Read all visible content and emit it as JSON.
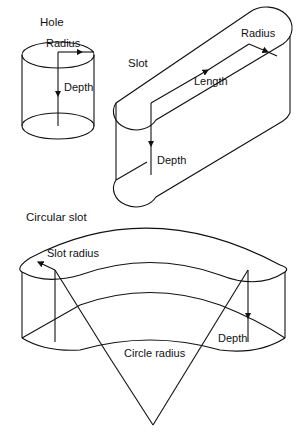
{
  "figure": {
    "hole": {
      "title": "Hole",
      "labels": {
        "radius": "Radius",
        "depth": "Depth"
      }
    },
    "slot": {
      "title": "Slot",
      "labels": {
        "radius": "Radius",
        "length": "Length",
        "depth": "Depth"
      }
    },
    "circular_slot": {
      "title": "Circular slot",
      "labels": {
        "slot_radius": "Slot radius",
        "depth": "Depth",
        "circle_radius": "Circle radius"
      }
    }
  }
}
